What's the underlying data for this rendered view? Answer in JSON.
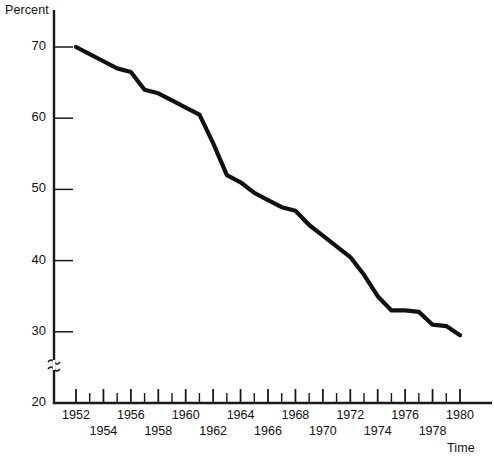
{
  "chart_data": {
    "type": "line",
    "title": "",
    "xlabel": "Time",
    "ylabel": "Percent",
    "ylim": [
      20,
      72
    ],
    "xlim": [
      1951,
      1981
    ],
    "grid": false,
    "legend": null,
    "y_axis_break": true,
    "y_axis_break_between": [
      20,
      30
    ],
    "y_ticks": [
      20,
      30,
      40,
      50,
      60,
      70
    ],
    "y_tick_labels": [
      "20",
      "30",
      "40",
      "50",
      "60",
      "70"
    ],
    "x_ticks": [
      1952,
      1953,
      1954,
      1955,
      1956,
      1957,
      1958,
      1959,
      1960,
      1961,
      1962,
      1963,
      1964,
      1965,
      1966,
      1967,
      1968,
      1969,
      1970,
      1971,
      1972,
      1973,
      1974,
      1975,
      1976,
      1977,
      1978,
      1979,
      1980
    ],
    "x_tick_labels_upper": [
      "1952",
      "1956",
      "1960",
      "1964",
      "1968",
      "1972",
      "1976",
      "1980"
    ],
    "x_tick_labels_lower": [
      "1954",
      "1958",
      "1962",
      "1966",
      "1970",
      "1974",
      "1978"
    ],
    "series": [
      {
        "name": "Percent",
        "x": [
          1952,
          1953,
          1954,
          1955,
          1956,
          1957,
          1958,
          1959,
          1960,
          1961,
          1962,
          1963,
          1964,
          1965,
          1966,
          1967,
          1968,
          1969,
          1970,
          1971,
          1972,
          1973,
          1974,
          1975,
          1976,
          1977,
          1978,
          1979,
          1980
        ],
        "values": [
          70.0,
          69.0,
          68.0,
          67.0,
          66.5,
          64.0,
          63.5,
          62.5,
          61.5,
          60.5,
          56.5,
          52.0,
          51.0,
          49.5,
          48.5,
          47.5,
          47.0,
          45.0,
          43.5,
          42.0,
          40.5,
          38.0,
          35.0,
          33.0,
          33.0,
          32.8,
          31.0,
          30.8,
          29.5
        ]
      }
    ]
  },
  "labels": {
    "y_axis_title": "Percent",
    "x_axis_title": "Time"
  }
}
